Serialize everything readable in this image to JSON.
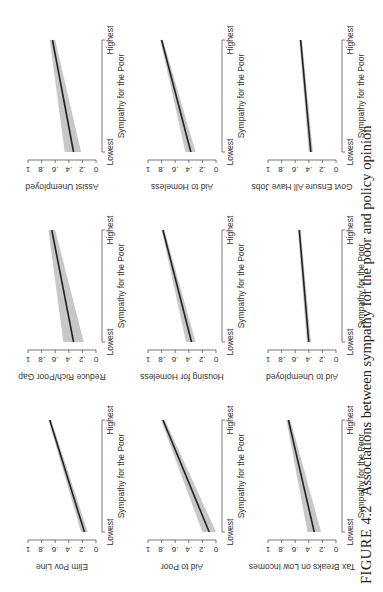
{
  "figure": {
    "number_label": "FIGURE 4.2",
    "caption": "Associations between sympathy for the poor and policy opinion"
  },
  "chart_data": {
    "type": "line",
    "layout": "3x3 small multiples (page rotated 90° counter-clockwise)",
    "xlabel": "Sympathy for the Poor",
    "x_ticks": [
      "Lowest",
      "Highest"
    ],
    "y_ticks": [
      "0",
      ".2",
      ".4",
      ".6",
      ".8",
      "1"
    ],
    "ylim": [
      0,
      1
    ],
    "grid": false,
    "legend": null,
    "note": "Each panel shows a fitted line with a shaded confidence band",
    "panels": [
      {
        "ylabel": "Elim Pov Line",
        "start": 0.17,
        "end": 0.68,
        "ci_low_start": 0.12,
        "ci_high_start": 0.22,
        "ci_low_end": 0.66,
        "ci_high_end": 0.7
      },
      {
        "ylabel": "Reduce Rich/Poor Gap",
        "start": 0.33,
        "end": 0.65,
        "ci_low_start": 0.18,
        "ci_high_start": 0.48,
        "ci_low_end": 0.6,
        "ci_high_end": 0.7
      },
      {
        "ylabel": "Assist Unemployed",
        "start": 0.33,
        "end": 0.64,
        "ci_low_start": 0.22,
        "ci_high_start": 0.46,
        "ci_low_end": 0.6,
        "ci_high_end": 0.68
      },
      {
        "ylabel": "Aid to Poor",
        "start": 0.1,
        "end": 0.78,
        "ci_low_start": 0.0,
        "ci_high_start": 0.2,
        "ci_low_end": 0.75,
        "ci_high_end": 0.81
      },
      {
        "ylabel": "Housing for Homeless",
        "start": 0.36,
        "end": 0.78,
        "ci_low_start": 0.3,
        "ci_high_start": 0.44,
        "ci_low_end": 0.76,
        "ci_high_end": 0.8
      },
      {
        "ylabel": "Aid to Homeless",
        "start": 0.37,
        "end": 0.8,
        "ci_low_start": 0.3,
        "ci_high_start": 0.45,
        "ci_low_end": 0.78,
        "ci_high_end": 0.82
      },
      {
        "ylabel": "Tax Breaks on Low Incomes",
        "start": 0.32,
        "end": 0.7,
        "ci_low_start": 0.22,
        "ci_high_start": 0.42,
        "ci_low_end": 0.67,
        "ci_high_end": 0.73
      },
      {
        "ylabel": "Aid to Unemployed",
        "start": 0.4,
        "end": 0.54,
        "ci_low_start": 0.37,
        "ci_high_start": 0.43,
        "ci_low_end": 0.52,
        "ci_high_end": 0.56
      },
      {
        "ylabel": "Govt Ensure All Have Jobs",
        "start": 0.37,
        "end": 0.52,
        "ci_low_start": 0.34,
        "ci_high_start": 0.4,
        "ci_low_end": 0.5,
        "ci_high_end": 0.54
      }
    ]
  },
  "colors": {
    "line": "#222222",
    "band": "#bdbdbd",
    "axis": "#555555",
    "text": "#333333"
  }
}
